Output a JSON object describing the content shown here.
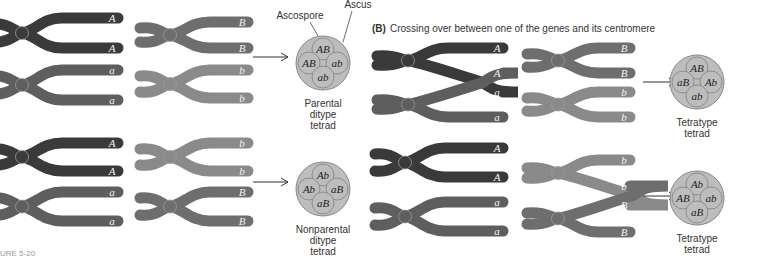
{
  "colors": {
    "gene_a_dark": "#3a3a3a",
    "gene_a_light": "#5e5e5e",
    "gene_b_mid": "#6e6e6e",
    "gene_b_light": "#8a8a8a",
    "ascus_fill": "#bdbdbd",
    "spore_stroke": "#888888",
    "arrow": "#333333"
  },
  "panel_b": {
    "tag": "(B)",
    "title": "Crossing over between one of the genes and its centromere"
  },
  "labels": {
    "ascospore": "Ascospore",
    "ascus": "Ascus"
  },
  "rows": [
    {
      "id": "a-top",
      "left_alleles": [
        "A",
        "A",
        "a",
        "a"
      ],
      "right_alleles": [
        "B",
        "B",
        "b",
        "b"
      ],
      "tetrad": {
        "spores": [
          "AB",
          "AB",
          "ab",
          "ab"
        ],
        "caption": [
          "Parental",
          "ditype",
          "tetrad"
        ]
      }
    },
    {
      "id": "a-bottom",
      "left_alleles": [
        "A",
        "A",
        "a",
        "a"
      ],
      "right_alleles": [
        "b",
        "b",
        "B",
        "B"
      ],
      "tetrad": {
        "spores": [
          "Ab",
          "Ab",
          "aB",
          "aB"
        ],
        "caption": [
          "Nonparental",
          "ditype",
          "tetrad"
        ]
      }
    },
    {
      "id": "b-top",
      "left_alleles": [
        "A",
        "A",
        "a",
        "a"
      ],
      "right_alleles": [
        "B",
        "B",
        "b",
        "b"
      ],
      "tetrad": {
        "spores": [
          "AB",
          "aB",
          "Ab",
          "ab"
        ],
        "caption": [
          "Tetratype",
          "tetrad"
        ]
      }
    },
    {
      "id": "b-bottom",
      "left_alleles": [
        "A",
        "A",
        "a",
        "a"
      ],
      "right_alleles": [
        "b",
        "b",
        "B",
        "B"
      ],
      "tetrad": {
        "spores": [
          "Ab",
          "AB",
          "ab",
          "aB"
        ],
        "caption": [
          "Tetratype",
          "tetrad"
        ]
      }
    }
  ],
  "footer": {
    "caption_fragment": "URE 5-20"
  }
}
